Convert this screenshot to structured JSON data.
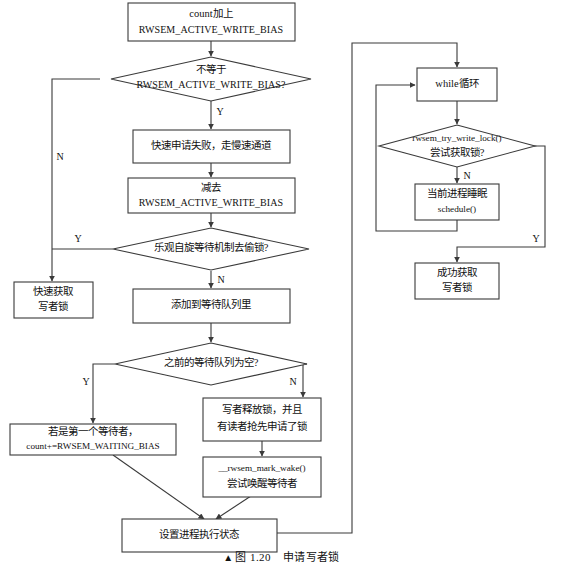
{
  "figure": {
    "caption_marker": "▲",
    "caption_label": "图 1.20",
    "caption_title": "申请写者锁",
    "background": "#ffffff",
    "line_color": "#3a3a3a",
    "text_color": "#111111"
  },
  "nodes": {
    "start_count_add": {
      "shape": "rect",
      "line1": "count加上",
      "line2": "RWSEM_ACTIVE_WRITE_BIAS"
    },
    "decision_not_equal": {
      "shape": "diamond",
      "line1": "不等于",
      "line2": "RWSEM_ACTIVE_WRITE_BIAS?"
    },
    "fast_fail": {
      "shape": "rect",
      "line1": "快速申请失败，走慢速通道"
    },
    "subtract_bias": {
      "shape": "rect",
      "line1": "减去",
      "line2": "RWSEM_ACTIVE_WRITE_BIAS"
    },
    "decision_optimistic_spin": {
      "shape": "diamond",
      "line1": "乐观自旋等待机制去偷锁?"
    },
    "fast_acquire_write_lock": {
      "shape": "rect",
      "line1": "快速获取",
      "line2": "写者锁"
    },
    "add_to_wait_queue": {
      "shape": "rect",
      "line1": "添加到等待队列里"
    },
    "decision_queue_empty": {
      "shape": "diamond",
      "line1": "之前的等待队列为空?"
    },
    "first_waiter": {
      "shape": "rect",
      "line1": "若是第一个等待者，",
      "line2": "count+=RWSEM_WAITING_BIAS"
    },
    "writer_released": {
      "shape": "rect",
      "line1": "写者释放锁，并且",
      "line2": "有读者抢先申请了锁"
    },
    "mark_wake": {
      "shape": "rect",
      "line1": "__rwsem_mark_wake()",
      "line2": "尝试唤醒等待者"
    },
    "set_process_state": {
      "shape": "rect",
      "line1": "设置进程执行状态"
    },
    "while_loop": {
      "shape": "rect",
      "line1": "while循环"
    },
    "decision_try_write_lock": {
      "shape": "diamond",
      "line1": "rwsem_try_write_lock()",
      "line2": "尝试获取锁?"
    },
    "sleep_schedule": {
      "shape": "rect",
      "line1": "当前进程睡眠",
      "line2": "schedule()"
    },
    "success_acquire": {
      "shape": "rect",
      "line1": "成功获取",
      "line2": "写者锁"
    }
  },
  "branch_labels": {
    "not_equal_yes": "Y",
    "not_equal_no": "N",
    "optimistic_yes": "Y",
    "optimistic_no": "N",
    "queue_empty_yes": "Y",
    "queue_empty_no": "N",
    "try_lock_no": "N",
    "try_lock_yes": "Y"
  }
}
